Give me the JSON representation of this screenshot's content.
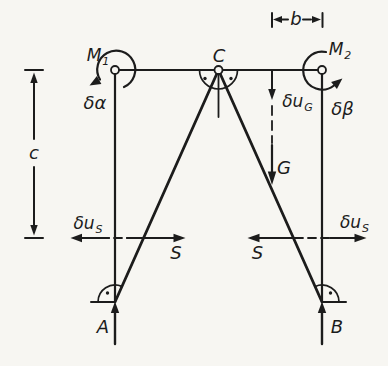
{
  "colors": {
    "background": "#f7f6f2",
    "ink": "#1c1c1c"
  },
  "labels": {
    "moment_left": {
      "base": "M",
      "sub": "1"
    },
    "moment_right": {
      "base": "M",
      "sub": "2"
    },
    "joint_center": "C",
    "virtual_rotation_left": "δα",
    "virtual_rotation_right": "δβ",
    "virtual_displacement_g": {
      "base": "δu",
      "sub": "G"
    },
    "load_g": "G",
    "dim_c": "c",
    "dim_b": "b",
    "virtual_displacement_s_left": {
      "base": "δu",
      "sub": "S"
    },
    "virtual_displacement_s_right": {
      "base": "δu",
      "sub": "S"
    },
    "bar_force_s_left": "S",
    "bar_force_s_right": "S",
    "reaction_a": "A",
    "reaction_b": "B"
  }
}
